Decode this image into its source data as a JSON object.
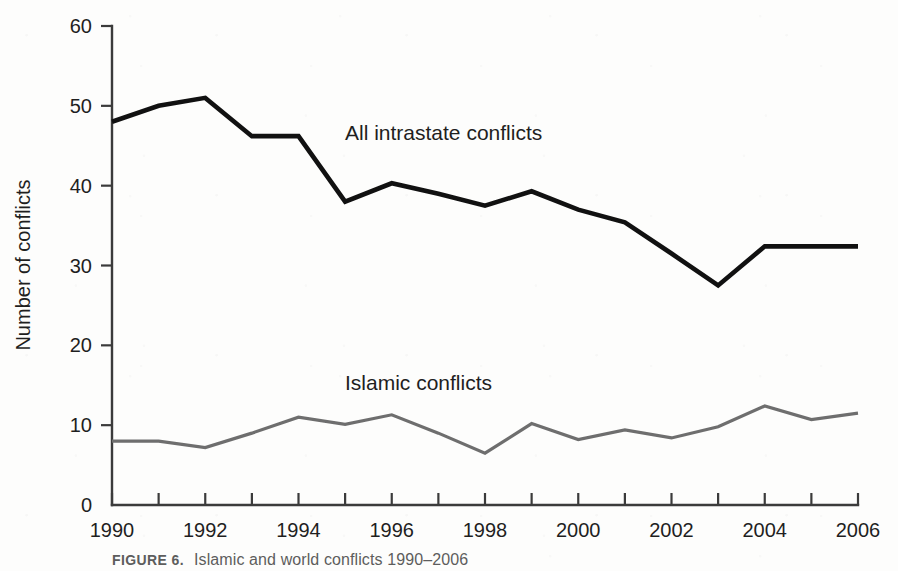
{
  "figure": {
    "caption_label": "FIGURE 6.",
    "caption_text": "Islamic and world conflicts 1990–2006"
  },
  "annotations": {
    "all_intrastate_label": "All intrastate conflicts",
    "islamic_label": "Islamic conflicts"
  },
  "colors": {
    "all_intrastate": "#111111",
    "islamic": "#6e6e6e",
    "axis": "#3b3b3b",
    "background": "#fdfdfc"
  },
  "chart_data": {
    "type": "line",
    "title": "",
    "xlabel": "",
    "ylabel": "Number of conflicts",
    "xlim": [
      1990,
      2006
    ],
    "ylim": [
      0,
      60
    ],
    "grid": false,
    "legend": "inline-annotations",
    "y_ticks": [
      0,
      10,
      20,
      30,
      40,
      50,
      60
    ],
    "y_tick_labels": [
      "0",
      "10",
      "20",
      "30",
      "40",
      "50",
      "60"
    ],
    "x": [
      1990,
      1991,
      1992,
      1993,
      1994,
      1995,
      1996,
      1997,
      1998,
      1999,
      2000,
      2001,
      2002,
      2003,
      2004,
      2005,
      2006
    ],
    "x_ticks": [
      1990,
      1991,
      1992,
      1993,
      1994,
      1995,
      1996,
      1997,
      1998,
      1999,
      2000,
      2001,
      2002,
      2003,
      2004,
      2005,
      2006
    ],
    "x_tick_labels": [
      "1990",
      "",
      "1992",
      "",
      "1994",
      "",
      "1996",
      "",
      "1998",
      "",
      "2000",
      "",
      "2002",
      "",
      "2004",
      "",
      "2006"
    ],
    "series": [
      {
        "name": "All intrastate conflicts",
        "color": "#111111",
        "width": 4.6,
        "values": [
          48,
          50,
          51,
          46.2,
          46.2,
          38,
          40.3,
          39,
          37.5,
          39.3,
          37,
          35.4,
          31.5,
          27.5,
          32.4,
          32.4,
          32.4
        ]
      },
      {
        "name": "Islamic conflicts",
        "color": "#6e6e6e",
        "width": 3.2,
        "values": [
          8,
          8,
          7.2,
          9,
          11,
          10.1,
          11.3,
          9,
          6.5,
          10.2,
          8.2,
          9.4,
          8.4,
          9.8,
          12.4,
          10.7,
          11.5
        ]
      }
    ]
  }
}
